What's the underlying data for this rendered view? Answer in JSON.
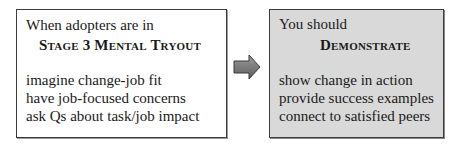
{
  "left_box": {
    "intro": "When adopters are in",
    "stage": "Stage 3 Mental Tryout",
    "items": [
      "imagine change-job fit",
      "have job-focused concerns",
      "ask Qs about task/job impact"
    ]
  },
  "arrow": {
    "icon": "right-arrow-icon",
    "color": "#7a7a7a"
  },
  "right_box": {
    "intro": "You should",
    "action": "Demonstrate",
    "items": [
      "show change in action",
      "provide success examples",
      "connect to satisfied peers"
    ],
    "background": "#d9d9d9"
  }
}
